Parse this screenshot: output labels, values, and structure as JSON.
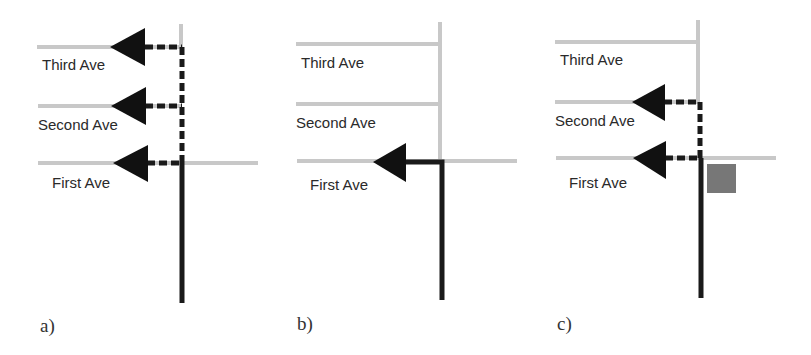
{
  "figure": {
    "panels": [
      {
        "id": "a",
        "label": "a)",
        "streets": [
          "Third Ave",
          "Second Ave",
          "First Ave"
        ],
        "description": "Dashed route options to Third, Second and First Ave"
      },
      {
        "id": "b",
        "label": "b)",
        "streets": [
          "Third Ave",
          "Second Ave",
          "First Ave"
        ],
        "description": "Solid route turning left at First Ave"
      },
      {
        "id": "c",
        "label": "c)",
        "streets": [
          "Third Ave",
          "Second Ave",
          "First Ave"
        ],
        "description": "Dashed route options to Second and First Ave with landmark square"
      }
    ],
    "colors": {
      "street": "#c8c8c8",
      "route": "#1a1a1a",
      "landmark": "#777777",
      "text": "#2a2a2a"
    }
  }
}
